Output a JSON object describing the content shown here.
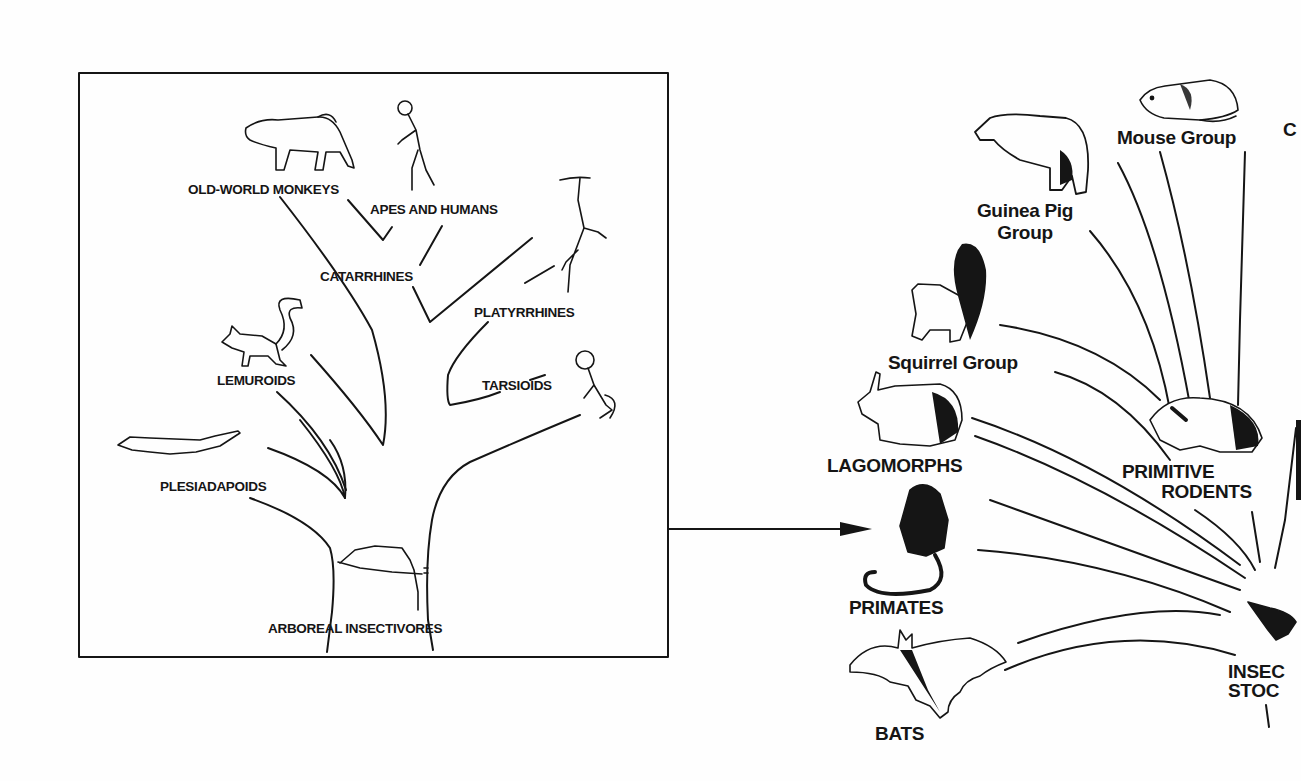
{
  "diagram": {
    "type": "phylogenetic-tree",
    "colors": {
      "ink": "#151515",
      "paper": "#fefefe"
    },
    "primate_tree": {
      "frame": "boxed inset",
      "root": "ARBOREAL INSECTIVORES",
      "labels": {
        "old_world_monkeys": "OLD-WORLD MONKEYS",
        "apes_and_humans": "APES AND HUMANS",
        "catarrhines": "CATARRHINES",
        "platyrrhines": "PLATYRRHINES",
        "lemuroids": "LEMUROIDS",
        "tarsioids": "TARSIOIDS",
        "plesiadapoids": "PLESIADAPOIDS",
        "arboreal_insectivores": "ARBOREAL INSECTIVORES"
      },
      "icons": [
        "baboon-icon",
        "ape-icon",
        "spider-monkey-icon",
        "lemur-icon",
        "tarsier-icon",
        "plesiadapis-icon",
        "tree-shrew-icon"
      ]
    },
    "connector": {
      "from": "primate-tree-box",
      "to": "primates",
      "style": "arrow"
    },
    "mammal_radiation": {
      "root": "INSECTIVORE STOCK (cropped)",
      "labels": {
        "mouse_group": "Mouse Group",
        "guinea_pig_line1": "Guinea Pig",
        "guinea_pig_line2": "Group",
        "squirrel_group": "Squirrel Group",
        "lagomorphs": "LAGOMORPHS",
        "primitive_line1": "PRIMITIVE",
        "primitive_line2": "RODENTS",
        "primates": "PRIMATES",
        "bats": "BATS",
        "insect_line1": "INSEC",
        "insect_line2": "STOC",
        "cropped_c": "C"
      },
      "icons": [
        "mouse-icon",
        "guinea-pig-icon",
        "squirrel-icon",
        "rabbit-icon",
        "primitive-rodent-icon",
        "monkey-icon",
        "bat-icon",
        "shrew-icon"
      ]
    }
  }
}
